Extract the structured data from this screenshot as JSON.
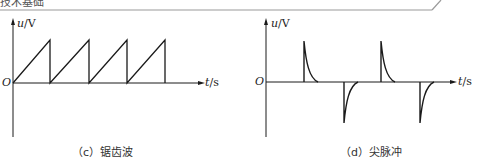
{
  "header": {
    "partial_text": "技术基础"
  },
  "figures": [
    {
      "id": "c",
      "caption": "（c）锯齿波",
      "y_axis_label_var": "u",
      "y_axis_label_unit": "/V",
      "x_axis_label_var": "t",
      "x_axis_label_unit": "/s",
      "origin_label": "O"
    },
    {
      "id": "d",
      "caption": "（d）尖脉冲",
      "y_axis_label_var": "u",
      "y_axis_label_unit": "/V",
      "x_axis_label_var": "t",
      "x_axis_label_unit": "/s",
      "origin_label": "O"
    }
  ],
  "colors": {
    "line": "#1a1a1a",
    "header_rule": "#9a9a9a"
  }
}
